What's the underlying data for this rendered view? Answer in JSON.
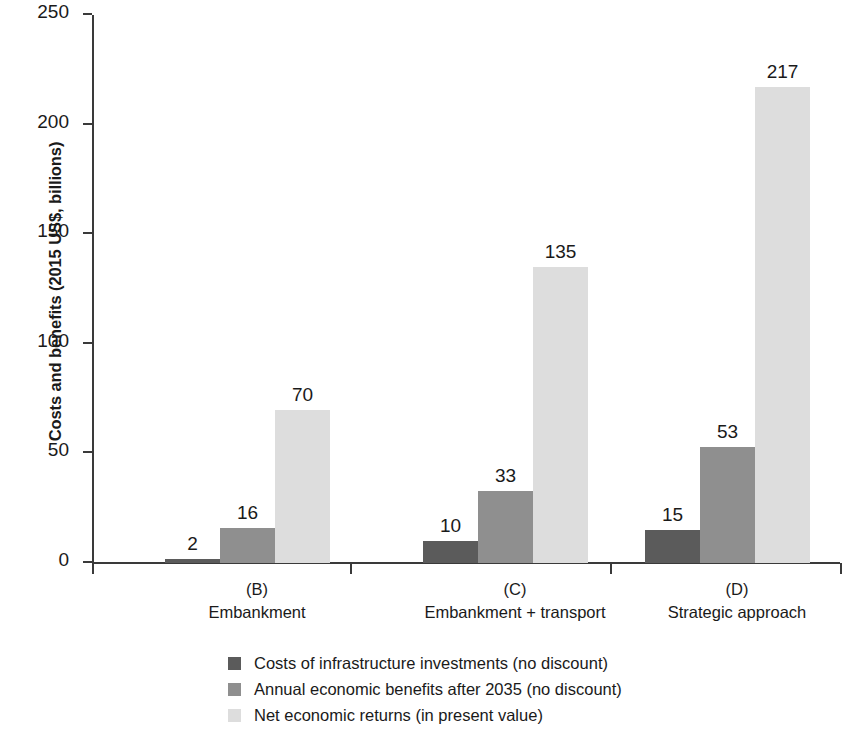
{
  "chart_data": {
    "type": "bar",
    "title": "",
    "subtitle": "",
    "xlabel": "",
    "ylabel": "Costs and benefits (2015 US$, billions)",
    "ylim": [
      0,
      250
    ],
    "yticks": [
      0,
      50,
      100,
      150,
      200,
      250
    ],
    "ytick_labels": [
      "0",
      "50",
      "100",
      "150",
      "200",
      "250"
    ],
    "grid": false,
    "legend_position": "bottom",
    "categories": [
      "(B)\nEmbankment",
      "(C)\nEmbankment + transport",
      "(D)\nStrategic approach"
    ],
    "category_codes": [
      "(B)",
      "(C)",
      "(D)"
    ],
    "category_names": [
      "Embankment",
      "Embankment + transport",
      "Strategic approach"
    ],
    "series": [
      {
        "name": "Costs of infrastructure investments (no discount)",
        "color": "#5b5b5b",
        "values": [
          2,
          10,
          15
        ],
        "labels": [
          "2",
          "10",
          "15"
        ]
      },
      {
        "name": "Annual economic benefits after 2035 (no discount)",
        "color": "#8f8f8f",
        "values": [
          16,
          33,
          53
        ],
        "labels": [
          "16",
          "33",
          "53"
        ]
      },
      {
        "name": "Net economic returns (in present value)",
        "color": "#dddddd",
        "values": [
          70,
          135,
          217
        ],
        "labels": [
          "70",
          "135",
          "217"
        ]
      }
    ]
  },
  "axis": {
    "y_title": "Costs and benefits (2015 US$, billions)",
    "ticks": [
      "250",
      "200",
      "150",
      "100",
      "50",
      "0"
    ]
  },
  "x_labels": [
    {
      "code": "(B)",
      "name": "Embankment"
    },
    {
      "code": "(C)",
      "name": "Embankment + transport"
    },
    {
      "code": "(D)",
      "name": "Strategic approach"
    }
  ],
  "legend": {
    "items": [
      {
        "label": "Costs of infrastructure investments (no discount)",
        "color": "#5b5b5b"
      },
      {
        "label": "Annual economic benefits after 2035 (no discount)",
        "color": "#8f8f8f"
      },
      {
        "label": "Net economic returns (in present value)",
        "color": "#dddddd"
      }
    ]
  },
  "colors": {
    "axis": "#3a3a3a",
    "text": "#1a1a1a",
    "background": "#ffffff",
    "series_dark": "#5b5b5b",
    "series_mid": "#8f8f8f",
    "series_light": "#dddddd"
  }
}
